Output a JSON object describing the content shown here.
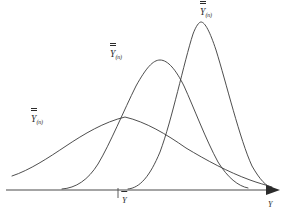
{
  "figure": {
    "background_color": "#ffffff",
    "curve_color": "#3a3a3a",
    "axis_color": "#4a4a4a",
    "text_color": "#2b2b2b"
  },
  "axis": {
    "x_arrow_label": "Y",
    "mean_tick_label": "Y",
    "mean_tick_subscript": "",
    "baseline_y": 190
  },
  "curves": [
    {
      "id": "wide",
      "label_symbol": "Y",
      "label_subscript": "(n)",
      "label_x": 31,
      "label_y": 115,
      "peak_x": 125,
      "peak_y": 117,
      "description": "flattest and widest distribution, smallest sample size",
      "path": "M 12,176 C 30,170 48,158 66,146 C 84,134 104,122 125,117 C 146,122 166,134 186,148 C 206,160 228,172 250,180 C 258,183 266,185 272,187"
    },
    {
      "id": "medium",
      "label_symbol": "Y",
      "label_subscript": "(n)",
      "label_x": 110,
      "label_y": 50,
      "peak_x": 160,
      "peak_y": 60,
      "description": "intermediate width distribution, medium sample size",
      "path": "M 62,189 C 76,188 88,180 98,164 C 110,144 124,110 136,86 C 146,68 153,60 160,60 C 168,60 176,70 184,86 C 194,108 206,140 218,162 C 228,178 238,186 248,188"
    },
    {
      "id": "narrow",
      "label_symbol": "Y",
      "label_subscript": "(n)",
      "label_x": 200,
      "label_y": 8,
      "peak_x": 200,
      "peak_y": 22,
      "description": "tallest and narrowest distribution, largest sample size",
      "path": "M 128,189 C 140,188 150,176 160,152 C 172,120 184,62 193,34 C 196,26 199,22 201,22 C 205,22 210,32 216,50 C 226,82 240,140 252,166 C 260,180 266,186 272,188"
    }
  ],
  "chart_data": {
    "type": "line",
    "xlabel": "Y",
    "ylabel": "",
    "grid": false,
    "legend": "inline-curve-labels",
    "series": [
      {
        "name": "Y(n) small n",
        "peak_x": 125,
        "peak_height_rel": 0.42,
        "spread_rel": 1.0
      },
      {
        "name": "Y(n) medium n",
        "peak_x": 160,
        "peak_height_rel": 0.78,
        "spread_rel": 0.55
      },
      {
        "name": "Y(n) large n",
        "peak_x": 200,
        "peak_height_rel": 1.0,
        "spread_rel": 0.45
      }
    ],
    "annotations": [
      {
        "text": "Y",
        "x": 118,
        "y": 190,
        "note": "mean tick mark on horizontal axis"
      },
      {
        "text": "Y",
        "x": 272,
        "y": 205,
        "note": "horizontal axis variable label"
      }
    ]
  }
}
